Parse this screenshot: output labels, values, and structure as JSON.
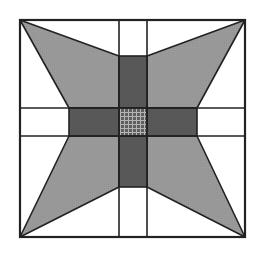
{
  "figure": {
    "title": "",
    "width": 255,
    "height": 257,
    "colors": {
      "background": "#ffffff",
      "wing": "#9a9a9a",
      "cross": "#585858",
      "center": "#5e5e5e",
      "center_grid": "#b0b0b0",
      "stroke": "#222222"
    },
    "outer_box": {
      "x1": 20,
      "y1": 20,
      "x2": 245,
      "y2": 237
    },
    "grid_lines": {
      "vertical": [
        119,
        147
      ],
      "horizontal": [
        108,
        136
      ]
    },
    "cross": {
      "vertical_bar": {
        "x1": 119,
        "x2": 147,
        "y1": 56,
        "y2": 187
      },
      "horizontal_bar": {
        "x1": 69,
        "x2": 197,
        "y1": 108,
        "y2": 136
      }
    },
    "center_square": {
      "x1": 119,
      "y1": 108,
      "x2": 147,
      "y2": 136
    },
    "wings": [
      {
        "name": "top-left",
        "points": "20,20 119,56 119,108 69,108"
      },
      {
        "name": "top-right",
        "points": "245,20 147,56 147,108 197,108"
      },
      {
        "name": "bottom-left",
        "points": "20,237 119,187 119,136 69,136"
      },
      {
        "name": "bottom-right",
        "points": "245,237 147,187 147,136 197,136"
      }
    ]
  }
}
